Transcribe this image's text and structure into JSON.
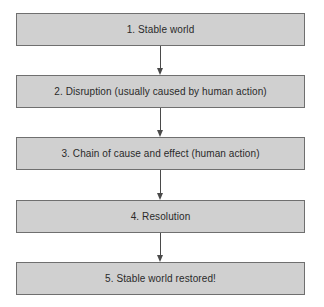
{
  "diagram": {
    "type": "flowchart",
    "direction": "top-to-bottom",
    "colors": {
      "box_fill": "#d0d0d0",
      "box_border": "#6f6f6f",
      "text": "#2a2a2a",
      "arrow": "#4a4a4a",
      "background": "#ffffff"
    },
    "steps": [
      {
        "label": "1. Stable world"
      },
      {
        "label": "2. Disruption (usually caused by human action)"
      },
      {
        "label": "3. Chain of cause and effect (human action)"
      },
      {
        "label": "4. Resolution"
      },
      {
        "label": "5. Stable world restored!"
      }
    ],
    "connections": [
      {
        "from": 1,
        "to": 2,
        "icon": "arrow-down-icon"
      },
      {
        "from": 2,
        "to": 3,
        "icon": "arrow-down-icon"
      },
      {
        "from": 3,
        "to": 4,
        "icon": "arrow-down-icon"
      },
      {
        "from": 4,
        "to": 5,
        "icon": "arrow-down-icon"
      }
    ]
  }
}
